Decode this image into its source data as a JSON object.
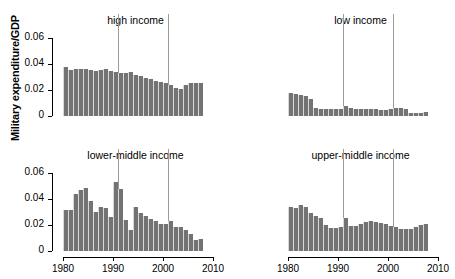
{
  "figure": {
    "ylabel": "Military expenditure/GDP",
    "background": "#ffffff",
    "bar_color": "#737373",
    "reference_line_color": "#9a9a9a"
  },
  "chart_data": {
    "type": "bar",
    "title": "",
    "xlabel": "",
    "ylabel": "Military expenditure/GDP",
    "ylim": [
      0,
      0.068
    ],
    "xlim": [
      1979,
      2010
    ],
    "grid": false,
    "legend": "none",
    "yticks": [
      0,
      0.02,
      0.04,
      0.06
    ],
    "ytick_labels": [
      "0",
      "0.02",
      "0.04",
      "0.06"
    ],
    "xticks": [
      1980,
      1990,
      2000,
      2010
    ],
    "xtick_labels": [
      "1980",
      "1990",
      "2000",
      "2010"
    ],
    "annotations": [
      {
        "type": "vline",
        "x": 1991,
        "note": "reference line"
      },
      {
        "type": "vline",
        "x": 2001,
        "note": "reference line"
      }
    ],
    "panels": [
      {
        "title": "high income",
        "position": "top-left",
        "x": [
          1980,
          1981,
          1982,
          1983,
          1984,
          1985,
          1986,
          1987,
          1988,
          1989,
          1990,
          1991,
          1992,
          1993,
          1994,
          1995,
          1996,
          1997,
          1998,
          1999,
          2000,
          2001,
          2002,
          2003,
          2004,
          2005,
          2006,
          2007
        ],
        "values": [
          0.038,
          0.0357,
          0.0362,
          0.0367,
          0.0366,
          0.0355,
          0.0347,
          0.0356,
          0.0361,
          0.035,
          0.0343,
          0.0335,
          0.0332,
          0.0337,
          0.032,
          0.0306,
          0.0293,
          0.0283,
          0.0272,
          0.0263,
          0.0253,
          0.0242,
          0.0219,
          0.0206,
          0.0237,
          0.0257,
          0.0255,
          0.0254
        ]
      },
      {
        "title": "low income",
        "position": "top-right",
        "x": [
          1980,
          1981,
          1982,
          1983,
          1984,
          1985,
          1986,
          1987,
          1988,
          1989,
          1990,
          1991,
          1992,
          1993,
          1994,
          1995,
          1996,
          1997,
          1998,
          1999,
          2000,
          2001,
          2002,
          2003,
          2004,
          2005,
          2006,
          2007
        ],
        "values": [
          0.0174,
          0.0167,
          0.0161,
          0.0157,
          0.0134,
          0.0065,
          0.0058,
          0.0056,
          0.0055,
          0.0054,
          0.0058,
          0.0074,
          0.006,
          0.0058,
          0.0056,
          0.0054,
          0.0053,
          0.0052,
          0.005,
          0.0046,
          0.0055,
          0.006,
          0.0059,
          0.0058,
          0.0026,
          0.002,
          0.0022,
          0.0028
        ]
      },
      {
        "title": "lower-middle income",
        "position": "bottom-left",
        "x": [
          1980,
          1981,
          1982,
          1983,
          1984,
          1985,
          1986,
          1987,
          1988,
          1989,
          1990,
          1991,
          1992,
          1993,
          1994,
          1995,
          1996,
          1997,
          1998,
          1999,
          2000,
          2001,
          2002,
          2003,
          2004,
          2005,
          2006,
          2007
        ],
        "values": [
          0.0315,
          0.0315,
          0.0443,
          0.0473,
          0.0486,
          0.0384,
          0.0305,
          0.0337,
          0.0331,
          0.0263,
          0.0536,
          0.0481,
          0.0239,
          0.0166,
          0.0341,
          0.0294,
          0.0274,
          0.0249,
          0.0233,
          0.0211,
          0.0206,
          0.023,
          0.0182,
          0.0182,
          0.0159,
          0.0134,
          0.0088,
          0.0094
        ]
      },
      {
        "title": "upper-middle income",
        "position": "bottom-right",
        "x": [
          1980,
          1981,
          1982,
          1983,
          1984,
          1985,
          1986,
          1987,
          1988,
          1989,
          1990,
          1991,
          1992,
          1993,
          1994,
          1995,
          1996,
          1997,
          1998,
          1999,
          2000,
          2001,
          2002,
          2003,
          2004,
          2005,
          2006,
          2007
        ],
        "values": [
          0.034,
          0.0336,
          0.0358,
          0.0338,
          0.0293,
          0.0271,
          0.0256,
          0.0201,
          0.0177,
          0.0175,
          0.0186,
          0.0254,
          0.0196,
          0.0193,
          0.021,
          0.0226,
          0.0229,
          0.0223,
          0.0218,
          0.0212,
          0.0197,
          0.0182,
          0.0171,
          0.0168,
          0.0173,
          0.0186,
          0.0202,
          0.021
        ]
      }
    ]
  }
}
